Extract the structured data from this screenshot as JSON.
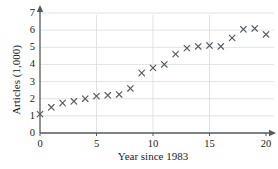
{
  "figure": {
    "clipped_heading": "",
    "background_color": "#ffffff",
    "marker_color": "#555a60",
    "grid_color": "#d9dade",
    "axis_color": "#55585d"
  },
  "chart_data": {
    "type": "scatter",
    "title": "",
    "xlabel": "Year since 1983",
    "ylabel": "Articles (1,000)",
    "xlim": [
      0,
      20
    ],
    "ylim": [
      0,
      7
    ],
    "xticks": [
      0,
      5,
      10,
      15,
      20
    ],
    "yticks": [
      0,
      1,
      2,
      3,
      4,
      5,
      6,
      7
    ],
    "xtick_labels": [
      "0",
      "5",
      "10",
      "15",
      "20"
    ],
    "ytick_labels": [
      "0",
      "1",
      "2",
      "3",
      "4",
      "5",
      "6",
      "7"
    ],
    "grid": true,
    "grid_axis": "y",
    "legend": null,
    "marker": "x",
    "x": [
      0,
      1,
      2,
      3,
      4,
      5,
      6,
      7,
      8,
      9,
      10,
      11,
      12,
      13,
      14,
      15,
      16,
      17,
      18,
      19,
      20
    ],
    "y": [
      1.1,
      1.5,
      1.75,
      1.85,
      2.0,
      2.15,
      2.2,
      2.25,
      2.6,
      3.5,
      3.8,
      4.0,
      4.6,
      4.95,
      5.05,
      5.1,
      5.05,
      5.55,
      6.05,
      6.1,
      5.75
    ],
    "points": [
      {
        "x": 0,
        "y": 1.1
      },
      {
        "x": 1,
        "y": 1.5
      },
      {
        "x": 2,
        "y": 1.75
      },
      {
        "x": 3,
        "y": 1.85
      },
      {
        "x": 4,
        "y": 2.0
      },
      {
        "x": 5,
        "y": 2.15
      },
      {
        "x": 6,
        "y": 2.2
      },
      {
        "x": 7,
        "y": 2.25
      },
      {
        "x": 8,
        "y": 2.6
      },
      {
        "x": 9,
        "y": 3.5
      },
      {
        "x": 10,
        "y": 3.8
      },
      {
        "x": 11,
        "y": 4.0
      },
      {
        "x": 12,
        "y": 4.6
      },
      {
        "x": 13,
        "y": 4.95
      },
      {
        "x": 14,
        "y": 5.05
      },
      {
        "x": 15,
        "y": 5.1
      },
      {
        "x": 16,
        "y": 5.05
      },
      {
        "x": 17,
        "y": 5.55
      },
      {
        "x": 18,
        "y": 6.05
      },
      {
        "x": 19,
        "y": 6.1
      },
      {
        "x": 20,
        "y": 5.75
      }
    ]
  }
}
